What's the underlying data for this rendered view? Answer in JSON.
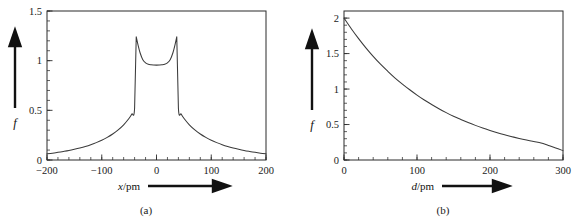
{
  "figure": {
    "panels": [
      {
        "id": "a",
        "subcaption": "(a)",
        "xlabel_symbol": "x",
        "xlabel_unit": "/pm",
        "ylabel": "f",
        "chart_data": {
          "type": "line",
          "title": "",
          "xlabel": "x/pm",
          "ylabel": "f",
          "xlim": [
            -200,
            200
          ],
          "ylim": [
            0,
            1.5
          ],
          "xticks": [
            -200,
            -100,
            0,
            100,
            200
          ],
          "xtick_labels": [
            "−200",
            "−100",
            "0",
            "100",
            "200"
          ],
          "yticks": [
            0,
            0.5,
            1,
            1.5
          ],
          "ytick_labels": [
            "0",
            "0.5",
            "1",
            "1.5"
          ],
          "x_minor_step": 20,
          "y_minor_step": 0.1,
          "grid": false,
          "legend": "none",
          "description": "Two-centre electron density: cusped maxima at the two nuclei with a shallow saddle between them and decaying tails.",
          "x": [
            -200,
            -190,
            -180,
            -170,
            -160,
            -150,
            -140,
            -130,
            -120,
            -110,
            -100,
            -90,
            -80,
            -70,
            -60,
            -50,
            -45,
            -40,
            -37,
            -34,
            -30,
            -25,
            -20,
            -15,
            -10,
            -5,
            0,
            5,
            10,
            15,
            20,
            25,
            30,
            34,
            37,
            40,
            45,
            50,
            60,
            70,
            80,
            90,
            100,
            110,
            120,
            130,
            140,
            150,
            160,
            170,
            180,
            190,
            200
          ],
          "values": [
            0.062,
            0.069,
            0.077,
            0.086,
            0.096,
            0.108,
            0.121,
            0.136,
            0.154,
            0.175,
            0.199,
            0.228,
            0.262,
            0.303,
            0.354,
            0.42,
            0.462,
            0.524,
            1.24,
            1.165,
            1.08,
            1.01,
            0.978,
            0.963,
            0.958,
            0.956,
            0.955,
            0.956,
            0.958,
            0.963,
            0.978,
            1.01,
            1.08,
            1.165,
            1.24,
            0.524,
            0.462,
            0.42,
            0.354,
            0.303,
            0.262,
            0.228,
            0.199,
            0.175,
            0.154,
            0.136,
            0.121,
            0.108,
            0.096,
            0.086,
            0.077,
            0.069,
            0.062
          ]
        }
      },
      {
        "id": "b",
        "subcaption": "(b)",
        "xlabel_symbol": "d",
        "xlabel_unit": "/pm",
        "ylabel": "f",
        "chart_data": {
          "type": "line",
          "title": "",
          "xlabel": "d/pm",
          "ylabel": "f",
          "xlim": [
            0,
            300
          ],
          "ylim": [
            0,
            2.1
          ],
          "xticks": [
            0,
            100,
            200,
            300
          ],
          "xtick_labels": [
            "0",
            "100",
            "200",
            "300"
          ],
          "yticks": [
            0,
            0.5,
            1,
            1.5,
            2
          ],
          "ytick_labels": [
            "0",
            "0.5",
            "1",
            "1.5",
            "2"
          ],
          "x_minor_step": 20,
          "y_minor_step": 0.1,
          "grid": false,
          "legend": "none",
          "description": "Monotonic decay of f with internuclear distance d, starting at 2 and falling towards about 0.13 at 300 pm.",
          "x": [
            0,
            10,
            20,
            30,
            40,
            50,
            60,
            70,
            80,
            90,
            100,
            110,
            120,
            130,
            140,
            150,
            160,
            170,
            180,
            190,
            200,
            210,
            220,
            230,
            240,
            250,
            260,
            270,
            280,
            290,
            300
          ],
          "values": [
            2.0,
            1.85,
            1.71,
            1.58,
            1.46,
            1.35,
            1.25,
            1.155,
            1.07,
            0.99,
            0.915,
            0.845,
            0.782,
            0.723,
            0.668,
            0.617,
            0.571,
            0.528,
            0.488,
            0.451,
            0.417,
            0.385,
            0.356,
            0.329,
            0.304,
            0.281,
            0.26,
            0.24,
            0.205,
            0.17,
            0.132
          ]
        }
      }
    ]
  }
}
